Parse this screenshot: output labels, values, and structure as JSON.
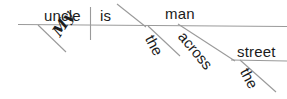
{
  "diagram": {
    "kind": "reed-kellogg-sentence-diagram",
    "sentence": "My uncle is the man across the street",
    "colors": {
      "ink": "#1b1b1b",
      "rule": "#9a9a9a",
      "background": "#ffffff"
    },
    "words": {
      "subject": "uncle",
      "verb": "is",
      "predicate_nominative": "man",
      "subject_modifier": "My",
      "predicate_modifier": "the",
      "preposition": "across",
      "prep_object": "street",
      "prep_object_modifier": "the"
    },
    "labels": {
      "subject": "uncle",
      "verb": "is",
      "predicate_nominative": "man",
      "subject_modifier": "My",
      "predicate_modifier": "the",
      "preposition": "across",
      "prep_object": "street",
      "prep_object_modifier": "the"
    }
  }
}
